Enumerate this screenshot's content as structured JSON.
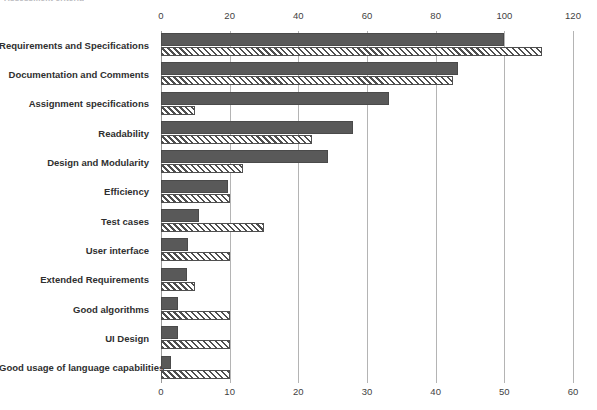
{
  "clipped_caption": "Assessment criteria",
  "chart_data": {
    "type": "bar",
    "orientation": "horizontal",
    "title": "",
    "subtitle": "",
    "xlabel": "",
    "ylabel": "",
    "grid": true,
    "legend_position": "none",
    "categories": [
      "Requirements and Specifications",
      "Documentation and Comments",
      "Assignment specifications",
      "Readability",
      "Design and Modularity",
      "Efficiency",
      "Test cases",
      "User interface",
      "Extended Requirements",
      "Good algorithms",
      "UI Design",
      "Good usage of language capabilities"
    ],
    "axes": {
      "top": {
        "label": "",
        "ticks": [
          0,
          20,
          40,
          60,
          80,
          100,
          120
        ],
        "range": [
          0,
          120
        ],
        "series": "Series 1"
      },
      "bottom": {
        "label": "",
        "ticks": [
          0,
          10,
          20,
          30,
          40,
          50,
          60
        ],
        "range": [
          0,
          60
        ],
        "series": "Series 2"
      }
    },
    "series": [
      {
        "name": "Series 1",
        "style": "solid",
        "color": "#595959",
        "axis": "top",
        "values": [
          100,
          86.5,
          66.5,
          56,
          48.5,
          19.5,
          11,
          8,
          7.5,
          5,
          5,
          3
        ]
      },
      {
        "name": "Series 2",
        "style": "hatched",
        "color": "#4f4f4f",
        "axis": "bottom",
        "values": [
          55.5,
          42.5,
          5,
          22,
          12,
          10,
          15,
          10,
          5,
          10,
          10,
          10
        ]
      }
    ]
  }
}
